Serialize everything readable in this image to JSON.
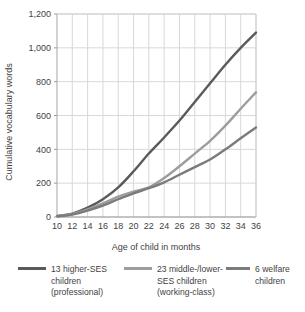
{
  "chart_data": {
    "type": "line",
    "title": "",
    "subtitle": "",
    "xlabel": "Age of child in months",
    "ylabel": "Cumulative vocabulary words",
    "xlim": [
      10,
      36
    ],
    "ylim": [
      0,
      1200
    ],
    "xticks": [
      10,
      12,
      14,
      16,
      18,
      20,
      22,
      24,
      26,
      28,
      30,
      32,
      34,
      36
    ],
    "xticklabels": [
      "10",
      "12",
      "14",
      "16",
      "18",
      "20",
      "22",
      "24",
      "26",
      "28",
      "30",
      "32",
      "34",
      "36"
    ],
    "yticks": [
      0,
      200,
      400,
      600,
      800,
      1000,
      1200
    ],
    "yticklabels": [
      "0",
      "200",
      "400",
      "600",
      "800",
      "1,000",
      "1,200"
    ],
    "grid": true,
    "grid_color": "#d8d8d8",
    "legend_position": "bottom",
    "x": [
      10,
      12,
      14,
      16,
      18,
      20,
      22,
      24,
      26,
      28,
      30,
      32,
      34,
      36
    ],
    "series": [
      {
        "name": "13 higher-SES children (professional)",
        "color": "#5a5a5a",
        "values": [
          5,
          20,
          55,
          105,
          175,
          270,
          375,
          470,
          570,
          680,
          790,
          900,
          1000,
          1090
        ]
      },
      {
        "name": "23 middle-/lower-SES children (working-class)",
        "color": "#9d9d9d",
        "values": [
          5,
          18,
          45,
          80,
          120,
          150,
          175,
          230,
          300,
          375,
          450,
          540,
          640,
          737
        ]
      },
      {
        "name": "6 welfare children",
        "color": "#7b7b7b",
        "values": [
          4,
          15,
          38,
          68,
          105,
          140,
          170,
          205,
          250,
          295,
          340,
          400,
          465,
          529
        ]
      }
    ]
  },
  "legend": {
    "items": [
      {
        "swatch_color": "#5a5a5a",
        "lines": [
          "13 higher-SES",
          "children",
          "(professional)"
        ]
      },
      {
        "swatch_color": "#9d9d9d",
        "lines": [
          "23 middle-/lower-",
          "SES children",
          "(working-class)"
        ]
      },
      {
        "swatch_color": "#7b7b7b",
        "lines": [
          "6 welfare",
          "children"
        ]
      }
    ]
  }
}
